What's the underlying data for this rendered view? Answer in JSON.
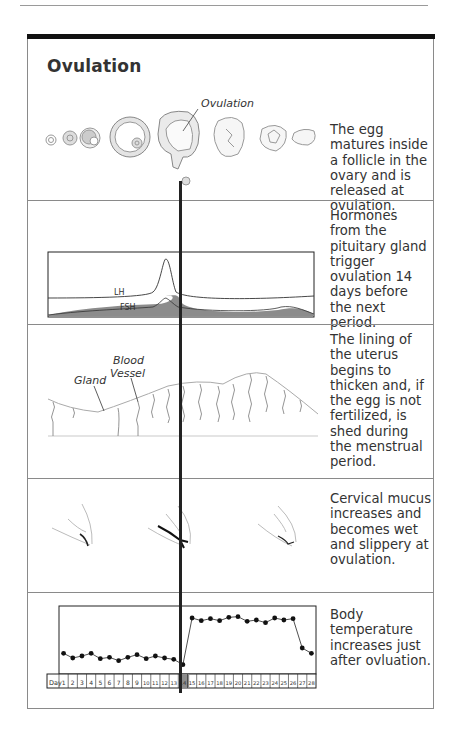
{
  "title": "Ovulation",
  "sections": [
    {
      "id": "follicle",
      "annotation": "Ovulation",
      "text": "The egg matures inside a follicle in the ovary and is released at ovulation."
    },
    {
      "id": "hormones",
      "labels": {
        "lh": "LH",
        "fsh": "FSH"
      },
      "text": "Hormones from the pituitary gland trigger ovulation 14 days before the next period."
    },
    {
      "id": "uterus",
      "labels": {
        "gland": "Gland",
        "vessel_line1": "Blood",
        "vessel_line2": "Vessel"
      },
      "text": "The lining of the uterus begins to thicken and, if the egg is not fertilized, is shed during the menstrual period."
    },
    {
      "id": "mucus",
      "text": "Cervical mucus increases and becomes wet and slippery at ovulation."
    },
    {
      "id": "temperature",
      "day_label": "Day",
      "text": "Body temperature increases just after ovluation."
    }
  ],
  "chart_data": [
    {
      "type": "line",
      "title": "Pituitary hormones",
      "xlabel": "",
      "ylabel": "",
      "grid": false,
      "x": [
        1,
        2,
        3,
        4,
        5,
        6,
        7,
        8,
        9,
        10,
        11,
        12,
        13,
        14,
        15,
        16,
        17,
        18,
        19,
        20,
        21,
        22,
        23,
        24,
        25,
        26,
        27,
        28
      ],
      "series": [
        {
          "name": "LH",
          "values": [
            13,
            13,
            13,
            13,
            13,
            13,
            13,
            14,
            14,
            15,
            16,
            20,
            32,
            80,
            20,
            17,
            16,
            16,
            15,
            15,
            15,
            15,
            15,
            15,
            16,
            16,
            16,
            16
          ]
        },
        {
          "name": "FSH",
          "values": [
            4,
            5,
            6,
            6,
            7,
            7,
            7,
            7,
            7,
            7,
            8,
            10,
            14,
            20,
            12,
            7,
            6,
            5,
            5,
            5,
            5,
            6,
            6,
            8,
            11,
            11,
            8,
            3
          ],
          "fill": "#888888"
        }
      ]
    },
    {
      "type": "line",
      "title": "Basal body temperature",
      "xlabel": "Day",
      "ylabel": "",
      "grid": false,
      "x": [
        1,
        2,
        3,
        4,
        5,
        6,
        7,
        8,
        9,
        10,
        11,
        12,
        13,
        14,
        15,
        16,
        17,
        18,
        19,
        20,
        21,
        22,
        23,
        24,
        25,
        26,
        27,
        28
      ],
      "values": [
        36.45,
        36.38,
        36.41,
        36.45,
        36.37,
        36.39,
        36.34,
        36.39,
        36.43,
        36.37,
        36.41,
        36.38,
        36.36,
        36.28,
        36.98,
        36.94,
        36.97,
        36.94,
        36.99,
        37.0,
        36.93,
        36.95,
        36.91,
        36.98,
        36.95,
        36.97,
        36.53,
        36.45
      ],
      "highlight_day": 14,
      "highlight_color": "#8c8c8c"
    }
  ]
}
